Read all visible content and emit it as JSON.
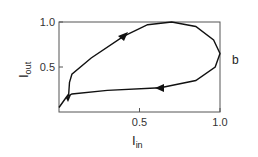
{
  "chart_data": {
    "type": "line",
    "title": "",
    "panel_label": "b",
    "xlabel": "I",
    "xlabel_sub": "in",
    "ylabel": "I",
    "ylabel_sub": "out",
    "xlim": [
      0,
      1.0
    ],
    "ylim": [
      0,
      1.0
    ],
    "xticks": [
      0.5,
      1.0
    ],
    "xtick_labels": [
      "0.5",
      "1.0"
    ],
    "yticks": [
      0.5,
      1.0
    ],
    "ytick_labels": [
      "0.5",
      "1.0"
    ],
    "grid": false,
    "legend": null,
    "annotations": [
      "arrow on upper branch pointing up-right",
      "arrow on lower branch pointing left",
      "arrow near origin pointing down-left"
    ],
    "series": [
      {
        "name": "hysteresis loop",
        "x": [
          0.0,
          0.04,
          0.06,
          0.065,
          0.08,
          0.2,
          0.4,
          0.55,
          0.7,
          0.85,
          0.96,
          1.0,
          0.97,
          0.85,
          0.63,
          0.3,
          0.08,
          0.06,
          0.04,
          0.0
        ],
        "y": [
          0.05,
          0.15,
          0.2,
          0.33,
          0.42,
          0.6,
          0.84,
          0.97,
          1.0,
          0.95,
          0.8,
          0.65,
          0.5,
          0.35,
          0.27,
          0.24,
          0.2,
          0.18,
          0.15,
          0.05
        ]
      }
    ]
  }
}
